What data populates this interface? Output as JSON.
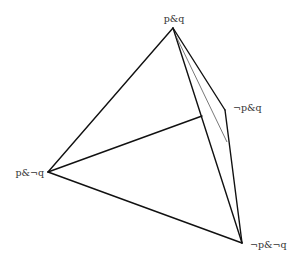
{
  "diagram": {
    "type": "tetrahedron",
    "vertices": {
      "top": {
        "label": "p&q",
        "x": 173,
        "y": 28
      },
      "right": {
        "label": "¬p&q",
        "x": 225,
        "y": 110
      },
      "left": {
        "label": "p&¬q",
        "x": 48,
        "y": 172
      },
      "bottom": {
        "label": "¬p&¬q",
        "x": 242,
        "y": 243
      }
    },
    "colors": {
      "edge": "#111111",
      "thin_edge": "#555555",
      "label": "#333333",
      "background": "#ffffff"
    }
  }
}
